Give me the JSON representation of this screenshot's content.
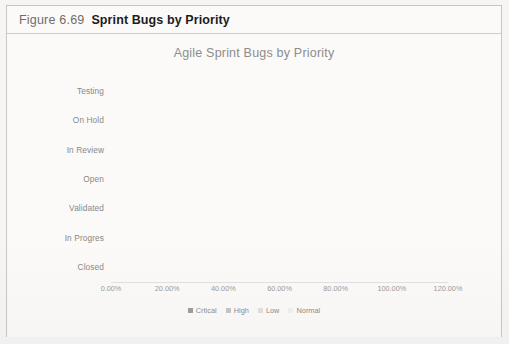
{
  "figure": {
    "number": "Figure 6.69",
    "caption": "Sprint Bugs by Priority"
  },
  "chart_data": {
    "type": "bar",
    "subtype": "horizontal-stacked-100",
    "title": "Agile Sprint Bugs by Priority",
    "xlabel": "",
    "ylabel": "",
    "xlim": [
      0,
      120
    ],
    "xticks": [
      "0.00%",
      "20.00%",
      "40.00%",
      "60.00%",
      "80.00%",
      "100.00%",
      "120.00%"
    ],
    "xtick_values": [
      0,
      20,
      40,
      60,
      80,
      100,
      120
    ],
    "grid": false,
    "legend_position": "bottom",
    "categories": [
      "Testing",
      "On Hold",
      "In Review",
      "Open",
      "Validated",
      "In Progres",
      "Closed"
    ],
    "series": [
      {
        "name": "Crtical",
        "color": "#9c9c9c",
        "values": [
          16,
          33,
          21,
          25,
          19,
          30,
          26
        ]
      },
      {
        "name": "High",
        "color": "#c4c4c4",
        "values": [
          33,
          27,
          32,
          22,
          28,
          28,
          24
        ]
      },
      {
        "name": "Low",
        "color": "#e0e0e0",
        "values": [
          26,
          18,
          25,
          26,
          22,
          6,
          23
        ]
      },
      {
        "name": "Normal",
        "color": "#efefef",
        "values": [
          24,
          15,
          20,
          27,
          29,
          34,
          27
        ]
      }
    ],
    "row_totals": [
      99,
      93,
      98,
      100,
      98,
      98,
      100
    ]
  },
  "colors": {
    "frame_border": "#c8c6c2",
    "page_background": "#f6f5f3",
    "panel_background": "#fbfaf9",
    "caption_number": "#6f6d6b",
    "caption_title": "#1c1c1c",
    "chart_title": "#8e8c8a",
    "tick_text": "#9b9997",
    "category_text": "#8a8886"
  }
}
